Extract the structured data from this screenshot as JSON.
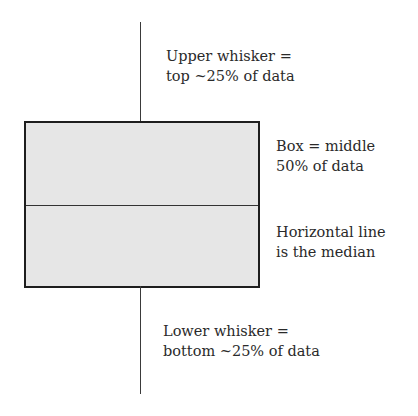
{
  "diagram": {
    "type": "box-plot-explanation",
    "labels": {
      "upper_whisker": [
        "Upper whisker =",
        "top ~25% of data"
      ],
      "box": [
        "Box = middle",
        "50% of data"
      ],
      "median": [
        "Horizontal line",
        "is the median"
      ],
      "lower_whisker": [
        "Lower whisker =",
        "bottom ~25% of data"
      ]
    },
    "colors": {
      "box_fill": "#e6e6e6",
      "stroke": "#1e1e1e",
      "text": "#2a2a2a"
    }
  }
}
